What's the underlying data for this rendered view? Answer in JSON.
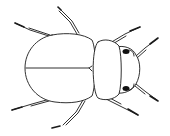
{
  "image": {
    "subject": "beetle line drawing",
    "view": "dorsal",
    "background": "#ffffff",
    "stroke": "#1a1a1a",
    "eye_fill": "#111111"
  }
}
